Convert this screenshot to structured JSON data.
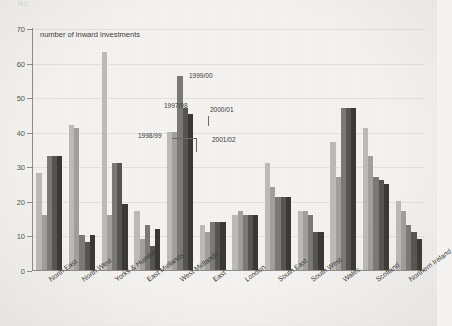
{
  "scan": {
    "header_fragment": "No."
  },
  "chart_data": {
    "type": "bar",
    "title": "",
    "subtitle": "",
    "xlabel": "",
    "ylabel": "number of inward investments",
    "ylim": [
      0,
      70
    ],
    "ytick_step": 10,
    "yticks": [
      0,
      10,
      20,
      30,
      40,
      50,
      60,
      70
    ],
    "ytick_labels": [
      "0",
      "10",
      "20",
      "30",
      "40",
      "50",
      "60",
      "70"
    ],
    "grid": true,
    "grid_axis": "y",
    "legend_position": "annotations-on-plot",
    "categories": [
      "North East",
      "North West",
      "Yorks & Humber",
      "East Midlands",
      "West Midlands",
      "East",
      "London",
      "South East",
      "South West",
      "Wales",
      "Scotland",
      "Northern Ireland"
    ],
    "series": [
      {
        "name": "1997/98",
        "color": "#bdbbb7",
        "values": [
          28,
          42,
          63,
          17,
          40,
          13,
          16,
          31,
          17,
          37,
          41,
          20
        ]
      },
      {
        "name": "1998/99",
        "color": "#a3a09c",
        "values": [
          16,
          41,
          16,
          9,
          40,
          11,
          17,
          24,
          17,
          27,
          33,
          17
        ]
      },
      {
        "name": "1999/00",
        "color": "#7c7a76",
        "values": [
          33,
          10,
          31,
          13,
          56,
          14,
          16,
          21,
          16,
          47,
          27,
          13
        ]
      },
      {
        "name": "2000/01",
        "color": "#57554f",
        "values": [
          33,
          8,
          31,
          7,
          47,
          14,
          16,
          21,
          11,
          47,
          26,
          11
        ]
      },
      {
        "name": "2001/02",
        "color": "#3b3935",
        "values": [
          33,
          10,
          19,
          12,
          45,
          14,
          16,
          21,
          11,
          47,
          25,
          9
        ]
      }
    ],
    "annotations": [
      {
        "label": "1997/98",
        "series_index": 0
      },
      {
        "label": "1998/99",
        "series_index": 1
      },
      {
        "label": "1999/00",
        "series_index": 2
      },
      {
        "label": "2000/01",
        "series_index": 3
      },
      {
        "label": "2001/02",
        "series_index": 4
      }
    ]
  }
}
